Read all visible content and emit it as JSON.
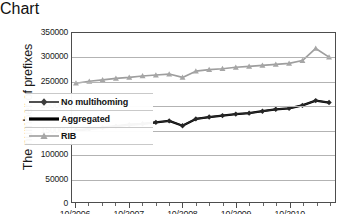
{
  "chart_data": {
    "type": "line",
    "title": "",
    "xlabel": "",
    "ylabel": "The number of prefixes",
    "ylim": [
      0,
      350000
    ],
    "ytick_labels": [
      "0",
      "50000",
      "100000",
      "150000",
      "200000",
      "250000",
      "300000",
      "350000"
    ],
    "ytick_values": [
      0,
      50000,
      100000,
      150000,
      200000,
      250000,
      300000,
      350000
    ],
    "xtick_labels": [
      "10/2006",
      "10/2007",
      "10/2008",
      "10/2009",
      "10/2010"
    ],
    "x": [
      "10/2006",
      "01/2007",
      "04/2007",
      "07/2007",
      "10/2007",
      "01/2008",
      "04/2008",
      "07/2008",
      "10/2008",
      "01/2009",
      "04/2009",
      "07/2009",
      "10/2009",
      "01/2010",
      "04/2010",
      "07/2010",
      "10/2010"
    ],
    "grid": "horizontal",
    "legend_position": "inside-lower-left",
    "series": [
      {
        "name": "No multihoming",
        "marker": "diamond",
        "color": "#262626",
        "values": [
          148000,
          151000,
          154000,
          157000,
          160000,
          162000,
          165000,
          168000,
          158000,
          172000,
          176000,
          179000,
          182000,
          184000,
          188000,
          192000,
          194000
        ]
      },
      {
        "name": "Aggregated",
        "marker": "none",
        "color": "#000000",
        "values": [
          148000,
          151000,
          154000,
          157000,
          160000,
          162000,
          165000,
          168000,
          158000,
          172000,
          176000,
          179000,
          182000,
          184000,
          188000,
          192000,
          194000
        ]
      },
      {
        "name": "RIB",
        "marker": "triangle",
        "color": "#9e9e9e",
        "values": [
          246000,
          250000,
          253000,
          256000,
          258000,
          261000,
          263000,
          265000,
          258000,
          271000,
          274000,
          276000,
          279000,
          281000,
          283000,
          285000,
          287000
        ]
      }
    ],
    "series_tail": {
      "note": "final segment extends past last quarterly tick",
      "no_multihoming_extra": [
        200000,
        210000,
        206000
      ],
      "rib_extra": [
        293000,
        318000,
        300000
      ]
    }
  },
  "legend": {
    "items": [
      {
        "label": "No multihoming",
        "key": "diamond-line-dark"
      },
      {
        "label": "Aggregated",
        "key": "thick-black-line"
      },
      {
        "label": "RIB",
        "key": "triangle-line-gray"
      }
    ]
  },
  "colors": {
    "dark_series": "#262626",
    "aggregated_series": "#000000",
    "rib_series": "#9e9e9e",
    "gridline": "#b3b3b3",
    "frame": "#4d4d4d",
    "background": "#ffffff"
  }
}
